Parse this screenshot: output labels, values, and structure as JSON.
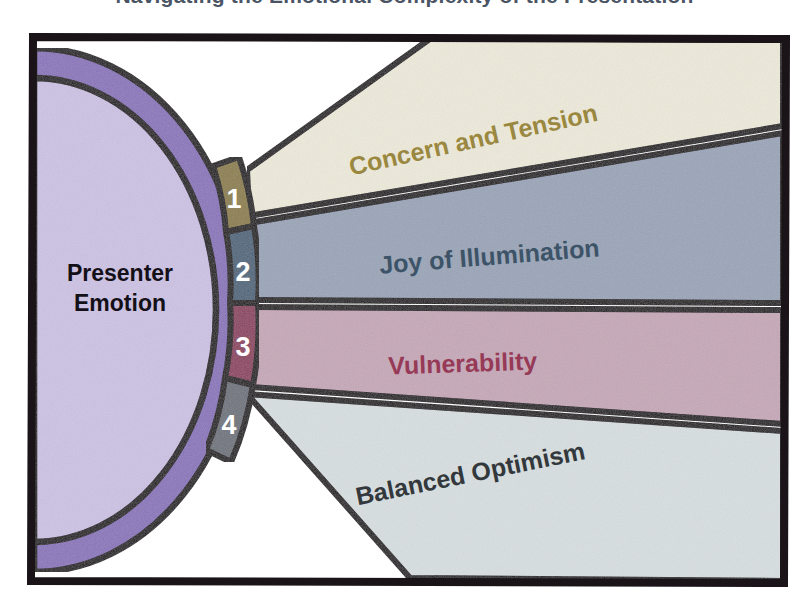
{
  "page": {
    "title_partial": "Navigating the Emotional Complexity of the Presentation",
    "background_color": "#ffffff"
  },
  "diagram": {
    "type": "fan-flow-diagram",
    "frame": {
      "stroke_color": "#1a1418",
      "stroke_width": 7
    },
    "hub": {
      "label_line1": "Presenter",
      "label_line2": "Emotion",
      "inner_fill": "#cdc2e4",
      "ring_fill": "#8a75bb",
      "label_color": "#141018"
    },
    "segments": [
      {
        "number": "1",
        "label": "Concern and Tension",
        "segment_color": "#8d7f4c",
        "band_color": "#edeadb",
        "text_color": "#9a8840",
        "text_rotation": -12
      },
      {
        "number": "2",
        "label": "Joy of Illumination",
        "segment_color": "#4f667c",
        "band_color": "#9aa5b8",
        "text_color": "#3d5468",
        "text_rotation": -4
      },
      {
        "number": "3",
        "label": "Vulnerability",
        "segment_color": "#8c4160",
        "band_color": "#c6a8b8",
        "text_color": "#963a57",
        "text_rotation": -2
      },
      {
        "number": "4",
        "label": "Balanced Optimism",
        "segment_color": "#6f737c",
        "band_color": "#d8dfe0",
        "text_color": "#33383c",
        "text_rotation": -11
      }
    ]
  }
}
